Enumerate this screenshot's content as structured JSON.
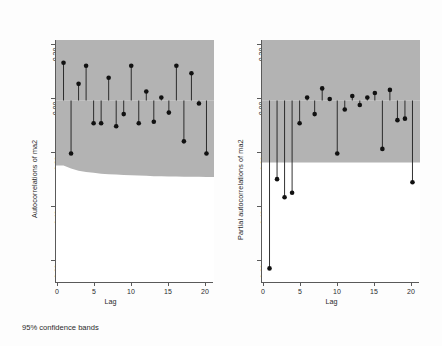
{
  "figure": {
    "footnote": "95% confidence bands",
    "band_color": "#b3b3b3",
    "point_color": "#111111",
    "stem_color": "#1c1c1c"
  },
  "chart_data": [
    {
      "type": "bar",
      "title": "",
      "panel": "left",
      "ylabel": "Autocorrelations of ma2",
      "xlabel": "Lag",
      "categories": [
        1,
        2,
        3,
        4,
        5,
        6,
        7,
        8,
        9,
        10,
        11,
        12,
        13,
        14,
        15,
        16,
        17,
        18,
        19,
        20
      ],
      "x": [
        1,
        2,
        3,
        4,
        5,
        6,
        7,
        8,
        9,
        10,
        11,
        12,
        13,
        14,
        15,
        16,
        17,
        18,
        19,
        20
      ],
      "values": [
        0.125,
        -0.175,
        0.055,
        0.115,
        -0.075,
        -0.075,
        0.075,
        -0.085,
        -0.045,
        0.115,
        -0.075,
        0.03,
        -0.07,
        0.01,
        -0.04,
        0.115,
        -0.135,
        0.09,
        -0.01,
        -0.175
      ],
      "ylim": [
        -0.6,
        0.2
      ],
      "xlim": [
        0,
        21
      ],
      "yticks": [
        0.2,
        0.0,
        -0.2,
        -0.4,
        -0.6
      ],
      "ytick_labels": [
        "0.20",
        "0.00",
        "-0.20",
        "-0.40",
        "-0.60"
      ],
      "xticks": [
        0,
        5,
        10,
        15,
        20
      ],
      "xtick_labels": [
        "0",
        "5",
        "10",
        "15",
        "20"
      ],
      "grid": false,
      "legend": "none",
      "confidence_band": {
        "level": "95%",
        "shape": "tapered",
        "upper": [
          0.215,
          0.225,
          0.232,
          0.236,
          0.239,
          0.242,
          0.244,
          0.245,
          0.246,
          0.247,
          0.248,
          0.249,
          0.25,
          0.25,
          0.251,
          0.251,
          0.252,
          0.252,
          0.252,
          0.253
        ],
        "lower": [
          -0.215,
          -0.225,
          -0.232,
          -0.236,
          -0.239,
          -0.242,
          -0.244,
          -0.245,
          -0.246,
          -0.247,
          -0.248,
          -0.249,
          -0.25,
          -0.25,
          -0.251,
          -0.251,
          -0.252,
          -0.252,
          -0.252,
          -0.253
        ]
      },
      "note_values_special": {
        "lag1_deep": -0.555
      }
    },
    {
      "type": "bar",
      "title": "",
      "panel": "right",
      "ylabel": "Partial autocorrelations of ma2",
      "xlabel": "Lag",
      "categories": [
        1,
        2,
        3,
        4,
        5,
        6,
        7,
        8,
        9,
        10,
        11,
        12,
        13,
        14,
        15,
        16,
        17,
        18,
        19,
        20
      ],
      "x": [
        1,
        2,
        3,
        4,
        5,
        6,
        7,
        8,
        9,
        10,
        11,
        12,
        13,
        14,
        15,
        16,
        17,
        18,
        19,
        20
      ],
      "values": [
        -0.555,
        -0.26,
        -0.32,
        -0.305,
        -0.075,
        0.01,
        -0.045,
        0.04,
        0.005,
        -0.175,
        -0.03,
        0.015,
        -0.015,
        0.01,
        0.025,
        -0.16,
        0.035,
        -0.065,
        -0.06,
        -0.27
      ],
      "ylim": [
        -0.6,
        0.2
      ],
      "xlim": [
        0,
        21
      ],
      "yticks": [
        0.2,
        0.0,
        -0.2,
        -0.4,
        -0.6
      ],
      "ytick_labels": [
        "0.20",
        "0.00",
        "-0.20",
        "-0.40",
        "-0.60"
      ],
      "xticks": [
        0,
        5,
        10,
        15,
        20
      ],
      "xtick_labels": [
        "0",
        "5",
        "10",
        "15",
        "20"
      ],
      "grid": false,
      "legend": "none",
      "confidence_band": {
        "level": "95%",
        "shape": "rectangular",
        "upper_constant": 0.205,
        "lower_constant": -0.205
      }
    }
  ]
}
